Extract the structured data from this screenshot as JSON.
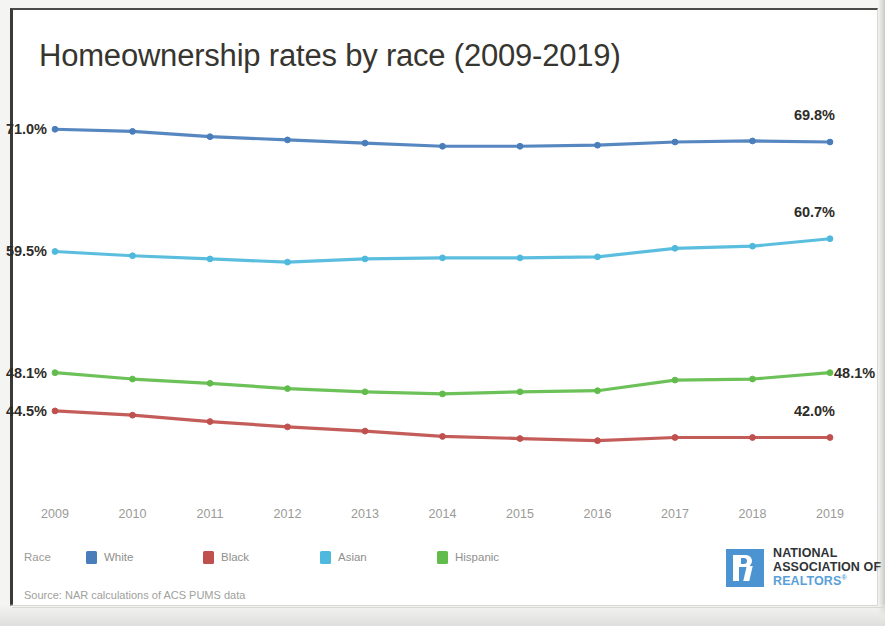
{
  "title": "Homeownership rates by race (2009-2019)",
  "source_note": "Source: NAR calculations of ACS PUMS data",
  "legend": {
    "title": "Race",
    "items": [
      {
        "label": "White",
        "color": "#4a7ebb"
      },
      {
        "label": "Black",
        "color": "#c0504d"
      },
      {
        "label": "Asian",
        "color": "#4fb9dd"
      },
      {
        "label": "Hispanic",
        "color": "#61bc4c"
      }
    ]
  },
  "logo": {
    "line1": "NATIONAL",
    "line2": "ASSOCIATION OF",
    "line3": "REALTORS",
    "registered": "®",
    "mark_color": "#4b93d1",
    "text_color": "#2f3337",
    "accent_color": "#5aa0d8"
  },
  "chart_data": {
    "type": "line",
    "title": "Homeownership rates by race (2009-2019)",
    "xlabel": "",
    "ylabel": "",
    "ylim": [
      38.0,
      73.0
    ],
    "grid": false,
    "legend_position": "bottom-left",
    "x": [
      "2009",
      "2010",
      "2011",
      "2012",
      "2013",
      "2014",
      "2015",
      "2016",
      "2017",
      "2018",
      "2019"
    ],
    "series": [
      {
        "name": "White",
        "color": "#4a7ebb",
        "values": [
          71.0,
          70.8,
          70.3,
          70.0,
          69.7,
          69.4,
          69.4,
          69.5,
          69.8,
          69.9,
          69.8
        ],
        "start_label": "71.0%",
        "end_label": "69.8%"
      },
      {
        "name": "Asian",
        "color": "#4fb9dd",
        "values": [
          59.5,
          59.1,
          58.8,
          58.5,
          58.8,
          58.9,
          58.9,
          59.0,
          59.8,
          60.0,
          60.7
        ],
        "start_label": "59.5%",
        "end_label": "60.7%"
      },
      {
        "name": "Hispanic",
        "color": "#61bc4c",
        "values": [
          48.1,
          47.5,
          47.1,
          46.6,
          46.3,
          46.1,
          46.3,
          46.4,
          47.4,
          47.5,
          48.1
        ],
        "start_label": "48.1%",
        "end_label": "48.1%"
      },
      {
        "name": "Black",
        "color": "#c0504d",
        "values": [
          44.5,
          44.1,
          43.5,
          43.0,
          42.6,
          42.1,
          41.9,
          41.7,
          42.0,
          42.0,
          42.0
        ],
        "start_label": "44.5%",
        "end_label": "42.0%"
      }
    ],
    "start_labels": [
      "71.0%",
      "59.5%",
      "48.1%",
      "44.5%"
    ],
    "end_labels": [
      "69.8%",
      "60.7%",
      "48.1%",
      "42.0%"
    ]
  }
}
